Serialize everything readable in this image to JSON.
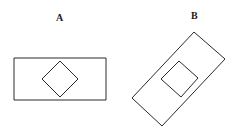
{
  "figures": [
    {
      "label": "A",
      "label_pos": [
        56,
        13
      ],
      "outer": "14,58 106,58 106,100 14,100",
      "inner": "60,61 78,79 60,97 42,79"
    },
    {
      "label": "B",
      "label_pos": [
        191,
        11
      ],
      "outer": "194,32 225,59 162,126 132,98",
      "inner": "179,61 198,78 181,97 161,79"
    }
  ],
  "colors": {
    "stroke": "#2a2a2a",
    "background": "#ffffff"
  }
}
